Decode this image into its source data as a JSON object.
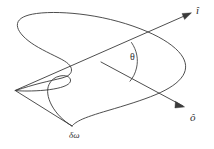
{
  "figure": {
    "kind": "geometry-diagram",
    "background_color": "#ffffff",
    "ink_color": "#3a3a3a"
  },
  "labels": {
    "incident_vector": "î",
    "outgoing_vector": "ô",
    "angle": "θ",
    "solid_angle": "δω"
  },
  "elements": {
    "surface_patch_name": "surface-patch-outline",
    "incident_ray_name": "incident-ray",
    "outgoing_ray_name": "outgoing-ray",
    "angle_arc_name": "angle-arc"
  }
}
